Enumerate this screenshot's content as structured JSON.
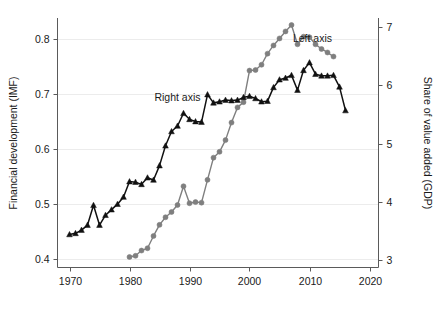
{
  "chart_data": {
    "type": "line",
    "title": "",
    "xlabel": "",
    "ylabel": "Financial development (IMF)",
    "y2label": "Share of value added (GDP)",
    "xlim": [
      1968,
      2021.5
    ],
    "ylim": [
      0.385,
      0.838
    ],
    "y2lim": [
      2.88,
      7.15
    ],
    "xticks": [
      1970,
      1980,
      1990,
      2000,
      2010,
      2020
    ],
    "xticklabels": [
      "1970",
      "1980",
      "1990",
      "2000",
      "2010",
      "2020"
    ],
    "yticks": [
      0.4,
      0.5,
      0.6,
      0.7,
      0.8
    ],
    "yticklabels": [
      "0.4",
      "0.5",
      "0.6",
      "0.7",
      "0.8"
    ],
    "y2ticks": [
      3,
      4,
      5,
      6,
      7
    ],
    "y2ticklabels": [
      "3",
      "4",
      "5",
      "6",
      "7"
    ],
    "grid": true,
    "grid_axis": "y",
    "legend_position": "inline-annotations",
    "annotations": [
      {
        "text": "Left axis",
        "x": 2010.5,
        "y": 0.795,
        "series": "share-of-value-added"
      },
      {
        "text": "Right axis",
        "x": 1988.0,
        "y": 0.687,
        "series": "financial-development"
      }
    ],
    "series": [
      {
        "name": "Share of value added (GDP)",
        "axis": "right",
        "marker": "circle",
        "color": "#7f7f7f",
        "x": [
          1980,
          1981,
          1982,
          1983,
          1984,
          1985,
          1986,
          1987,
          1988,
          1989,
          1990,
          1991,
          1992,
          1993,
          1994,
          1995,
          1996,
          1997,
          1998,
          1999,
          2000,
          2001,
          2002,
          2003,
          2004,
          2005,
          2006,
          2007,
          2008,
          2009,
          2010,
          2011,
          2012,
          2013,
          2014
        ],
        "values": [
          3.06,
          3.08,
          3.17,
          3.21,
          3.42,
          3.61,
          3.74,
          3.83,
          3.95,
          4.27,
          3.98,
          4.0,
          3.99,
          4.38,
          4.76,
          4.86,
          5.06,
          5.36,
          5.62,
          5.71,
          6.25,
          6.26,
          6.35,
          6.54,
          6.68,
          6.8,
          6.92,
          7.03,
          6.7,
          6.83,
          6.82,
          6.7,
          6.62,
          6.56,
          6.49
        ]
      },
      {
        "name": "Financial development (IMF)",
        "axis": "left",
        "marker": "triangle",
        "color": "#111111",
        "x": [
          1970,
          1971,
          1972,
          1973,
          1974,
          1975,
          1976,
          1977,
          1978,
          1979,
          1980,
          1981,
          1982,
          1983,
          1984,
          1985,
          1986,
          1987,
          1988,
          1989,
          1990,
          1991,
          1992,
          1993,
          1994,
          1995,
          1996,
          1997,
          1998,
          1999,
          2000,
          2001,
          2002,
          2003,
          2004,
          2005,
          2006,
          2007,
          2008,
          2009,
          2010,
          2011,
          2012,
          2013,
          2014,
          2015,
          2016
        ],
        "values": [
          0.445,
          0.447,
          0.453,
          0.462,
          0.498,
          0.462,
          0.48,
          0.49,
          0.5,
          0.513,
          0.541,
          0.54,
          0.536,
          0.548,
          0.544,
          0.57,
          0.606,
          0.632,
          0.642,
          0.665,
          0.654,
          0.65,
          0.649,
          0.699,
          0.684,
          0.686,
          0.689,
          0.688,
          0.689,
          0.694,
          0.696,
          0.692,
          0.686,
          0.687,
          0.712,
          0.726,
          0.729,
          0.734,
          0.707,
          0.743,
          0.757,
          0.736,
          0.733,
          0.733,
          0.734,
          0.713,
          0.67
        ]
      }
    ]
  },
  "axes": {
    "left_title": "Financial development (IMF)",
    "right_title": "Share of value added (GDP)"
  },
  "labels": {
    "left_axis_annotation": "Left axis",
    "right_axis_annotation": "Right axis"
  },
  "colors": {
    "series_gray": "#7f7f7f",
    "series_black": "#111111",
    "grid": "#ececec",
    "spine": "#5a5a5a",
    "text": "#1a1a1a",
    "background": "#ffffff"
  }
}
